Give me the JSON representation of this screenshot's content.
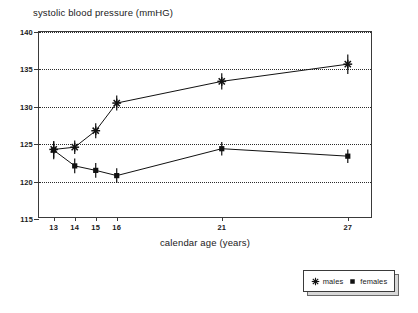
{
  "chart_data": {
    "type": "line",
    "title": "systolic blood pressure (mmHG)",
    "xlabel": "calendar age (years)",
    "ylabel": "",
    "x": [
      13,
      14,
      15,
      16,
      21,
      27
    ],
    "xticklabels": [
      "13",
      "14",
      "15",
      "16",
      "21",
      "27"
    ],
    "xlim": [
      12.3,
      28.2
    ],
    "ylim": [
      115,
      140
    ],
    "yticks": [
      115,
      120,
      125,
      130,
      135,
      140
    ],
    "yticklabels": [
      "115",
      "120",
      "125",
      "130",
      "135",
      "140"
    ],
    "grid": "horizontal-dotted",
    "gridlines": [
      120,
      125,
      130,
      135,
      140
    ],
    "legend_position": "bottom-right-outside",
    "series": [
      {
        "name": "males",
        "marker": "star",
        "color": "#111111",
        "values": [
          124.3,
          124.6,
          126.8,
          130.5,
          133.4,
          135.7
        ],
        "errors": [
          1.1,
          0.9,
          1.0,
          1.0,
          1.1,
          1.3
        ]
      },
      {
        "name": "females",
        "marker": "square",
        "color": "#111111",
        "values": [
          124.2,
          122.1,
          121.5,
          120.8,
          124.4,
          123.4
        ],
        "errors": [
          1.2,
          1.0,
          1.0,
          1.0,
          0.9,
          0.9
        ]
      }
    ]
  },
  "legend": {
    "entries": [
      {
        "label": "males",
        "icon": "star-marker-icon"
      },
      {
        "label": "females",
        "icon": "square-marker-icon"
      }
    ]
  }
}
